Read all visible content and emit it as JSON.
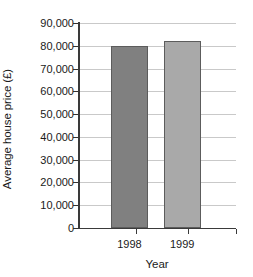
{
  "chart_data": {
    "type": "bar",
    "title": "",
    "subtitle": "",
    "xlabel": "Year",
    "ylabel": "Average house price (£)",
    "categories": [
      "1998",
      "1999"
    ],
    "values": [
      80000,
      82000
    ],
    "ylim": [
      0,
      90000
    ],
    "y_ticks": [
      0,
      10000,
      20000,
      30000,
      40000,
      50000,
      60000,
      70000,
      80000,
      90000
    ],
    "y_tick_labels": [
      "0",
      "10,000",
      "20,000",
      "30,000",
      "40,000",
      "50,000",
      "60,000",
      "70,000",
      "80,000",
      "90,000"
    ],
    "grid": true,
    "legend": false,
    "legend_position": "none",
    "bar_colors": [
      "#808080",
      "#a9a9a9"
    ],
    "bar_edge_color": "#5c5c5c",
    "gridline_color": "#c9c9c9",
    "axis_color": "#3a3a3a",
    "background_color": "#ffffff",
    "annotations": []
  }
}
